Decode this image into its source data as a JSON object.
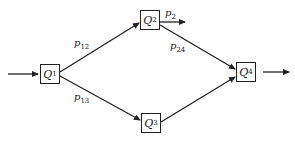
{
  "diagram": {
    "type": "queueing-network",
    "nodes": [
      {
        "id": "Q1",
        "letter": "Q",
        "sub": "1",
        "x": 40,
        "y": 64,
        "w": 20,
        "h": 20
      },
      {
        "id": "Q2",
        "letter": "Q",
        "sub": "2",
        "x": 140,
        "y": 10,
        "w": 20,
        "h": 20
      },
      {
        "id": "Q3",
        "letter": "Q",
        "sub": "3",
        "x": 141,
        "y": 113,
        "w": 20,
        "h": 20
      },
      {
        "id": "Q4",
        "letter": "Q",
        "sub": "4",
        "x": 236,
        "y": 62,
        "w": 20,
        "h": 20
      }
    ],
    "edges": [
      {
        "from": "input",
        "to": "Q1",
        "label": ""
      },
      {
        "from": "Q1",
        "to": "Q2",
        "label": "p12"
      },
      {
        "from": "Q1",
        "to": "Q3",
        "label": "p13"
      },
      {
        "from": "Q2",
        "to": "exit",
        "label": "p2"
      },
      {
        "from": "Q2",
        "to": "Q4",
        "label": "p24"
      },
      {
        "from": "Q3",
        "to": "Q4",
        "label": ""
      },
      {
        "from": "Q4",
        "to": "output",
        "label": ""
      }
    ],
    "labels": {
      "p12": {
        "letter": "p",
        "sub": "12"
      },
      "p13": {
        "letter": "p",
        "sub": "13"
      },
      "p2": {
        "letter": "p",
        "sub": "2"
      },
      "p24": {
        "letter": "p",
        "sub": "24"
      }
    },
    "colors": {
      "stroke": "#222222",
      "background": "#ffffff"
    }
  }
}
